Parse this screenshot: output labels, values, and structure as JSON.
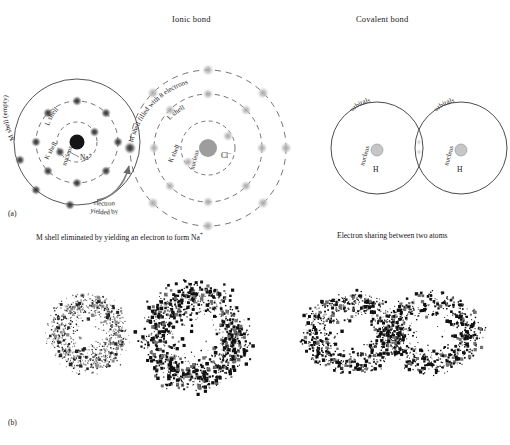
{
  "figure": {
    "panel_a_label": "(a)",
    "panel_b_label": "(b)",
    "titles": {
      "ionic": "Ionic bond",
      "covalent": "Covalent bond"
    },
    "captions": {
      "ionic": "M shell eliminated by yielding an electron to form Na",
      "ionic_sup": "+",
      "covalent": "Electron sharing between two atoms"
    }
  },
  "ionic": {
    "sodium": {
      "element_label": "Na",
      "charge": "+",
      "nucleus_label": "nucleus",
      "shells": [
        {
          "name": "K shell",
          "electrons": 2,
          "style": "dashed"
        },
        {
          "name": "L shell",
          "electrons": 8,
          "style": "dashed"
        },
        {
          "name": "M shell (empty)",
          "electrons": 0,
          "style": "solid"
        }
      ],
      "nucleus_color": "#1a1a1a",
      "electron_color": "#4a4a4a"
    },
    "chlorine": {
      "element_label": "Cl",
      "charge": "-",
      "nucleus_label": "nucleus",
      "shells": [
        {
          "name": "K shell",
          "electrons": 2,
          "style": "dashed"
        },
        {
          "name": "L shell",
          "electrons": 8,
          "style": "dashed"
        },
        {
          "name": "M shell filled with 8 electrons",
          "electrons": 8,
          "style": "dashed"
        }
      ],
      "nucleus_color": "#9a9a9a",
      "electron_color": "#b9b9b9",
      "transferred_electron_color": "#3a3a3a"
    },
    "transfer_annotation": {
      "line1": "electron",
      "line2": "yielded by"
    }
  },
  "covalent": {
    "left_atom": {
      "orbital_label": "orbitals",
      "nucleus_label": "nucleus",
      "element_label": "H"
    },
    "right_atom": {
      "orbital_label": "orbitals",
      "nucleus_label": "nucleus",
      "element_label": "H"
    },
    "nucleus_color": "#bfbfbf",
    "shared_electron_color": "#d0d0d0"
  },
  "electron_clouds": {
    "description": "Stippled probability-density electron clouds",
    "clouds": [
      {
        "name": "sodium-ion-cloud",
        "type": "spherical",
        "cx": 88,
        "cy": 333,
        "r": 46,
        "density": "light",
        "points": 900
      },
      {
        "name": "chloride-ion-cloud",
        "type": "spherical",
        "cx": 196,
        "cy": 337,
        "r": 62,
        "density": "heavy",
        "points": 1050
      },
      {
        "name": "hydrogen-molecule-cloud",
        "type": "dumbbell",
        "cx": 392,
        "cy": 333,
        "rx": 96,
        "ry": 48,
        "density": "heavy",
        "points": 1700
      }
    ]
  },
  "style": {
    "ink": "#1a1a1a",
    "shell_line": "#2b2b2b",
    "background": "#ffffff"
  }
}
